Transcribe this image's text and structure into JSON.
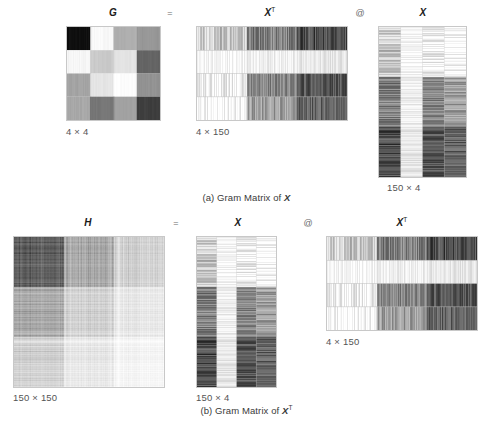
{
  "figure": {
    "panel_a": {
      "caption": "(a) Gram Matrix of ",
      "caption_symbol": "X",
      "equals": "=",
      "at": "@",
      "matrices": [
        {
          "name": "G",
          "sup": "",
          "dim": "4 × 4",
          "rows": 4,
          "cols": 4
        },
        {
          "name": "X",
          "sup": "T",
          "dim": "4 × 150",
          "rows": 4,
          "cols": 150
        },
        {
          "name": "X",
          "sup": "",
          "dim": "150 × 4",
          "rows": 150,
          "cols": 4
        }
      ]
    },
    "panel_b": {
      "caption": "(b) Gram Matrix of ",
      "caption_symbol": "X",
      "caption_symbol_sup": "T",
      "equals": "=",
      "at": "@",
      "matrices": [
        {
          "name": "H",
          "sup": "",
          "dim": "150 × 150",
          "rows": 150,
          "cols": 150
        },
        {
          "name": "X",
          "sup": "",
          "dim": "150 × 4",
          "rows": 150,
          "cols": 4
        },
        {
          "name": "X",
          "sup": "T",
          "dim": "4 × 150",
          "rows": 4,
          "cols": 150
        }
      ]
    }
  },
  "chart_data": {
    "type": "heatmap",
    "title": "",
    "colormap": "grayscale",
    "panels": [
      {
        "id": "a",
        "caption": "(a) Gram Matrix of X",
        "equation": "G = X^T @ X",
        "heatmaps": [
          {
            "name": "G",
            "shape": [
              4,
              4
            ],
            "values": [
              [
                0.06,
                0.97,
                0.63,
                0.58
              ],
              [
                0.96,
                0.76,
                0.87,
                0.37
              ],
              [
                0.64,
                0.88,
                0.99,
                0.56
              ],
              [
                0.66,
                0.38,
                0.57,
                0.22
              ]
            ]
          },
          {
            "name": "X^T",
            "shape": [
              4,
              150
            ],
            "row_band_means": [
              0.78,
              0.97,
              0.62,
              0.33
            ],
            "col_group_structure": "three species blocks of 50 columns; row 1 light-to-dark, row 2 near-white, row 3 mid then light, row 4 dark then mid"
          },
          {
            "name": "X",
            "shape": [
              150,
              4
            ],
            "col_means": [
              0.58,
              0.93,
              0.62,
              0.4
            ],
            "row_group_structure": "three species blocks of 50 rows"
          }
        ]
      },
      {
        "id": "b",
        "caption": "(b) Gram Matrix of X^T",
        "equation": "H = X @ X^T",
        "heatmaps": [
          {
            "name": "H",
            "shape": [
              150,
              150
            ],
            "block_means": [
              [
                0.72,
                0.9,
                0.94
              ],
              [
                0.9,
                0.98,
                0.96
              ],
              [
                0.94,
                0.96,
                0.82
              ]
            ],
            "note": "3x3 block structure of 50x50, dark top-left block, light center, medium bottom-right"
          },
          {
            "name": "X",
            "shape": [
              150,
              4
            ],
            "col_means": [
              0.58,
              0.93,
              0.62,
              0.4
            ]
          },
          {
            "name": "X^T",
            "shape": [
              4,
              150
            ],
            "row_band_means": [
              0.78,
              0.97,
              0.62,
              0.33
            ]
          }
        ]
      }
    ]
  }
}
